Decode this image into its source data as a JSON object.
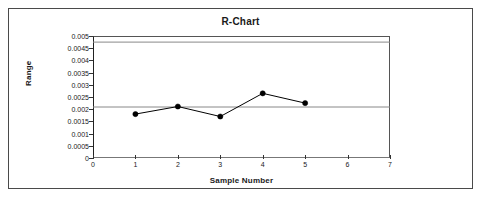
{
  "chart_data": {
    "type": "line",
    "title": "R-Chart",
    "xlabel": "Sample Number",
    "ylabel": "Range",
    "x": [
      1,
      2,
      3,
      4,
      5
    ],
    "values": [
      0.0018,
      0.00211,
      0.0017,
      0.00265,
      0.00225
    ],
    "series": [
      {
        "name": "Range",
        "values": [
          0.0018,
          0.00211,
          0.0017,
          0.00265,
          0.00225
        ]
      }
    ],
    "reference_lines": [
      {
        "name": "UCL",
        "value": 0.00475
      },
      {
        "name": "CL",
        "value": 0.00209
      },
      {
        "name": "LCL",
        "value": 0
      }
    ],
    "xlim": [
      0,
      7
    ],
    "ylim": [
      0,
      0.005
    ],
    "x_ticks": [
      0,
      1,
      2,
      3,
      4,
      5,
      6,
      7
    ],
    "x_tick_labels": [
      "0",
      "1",
      "2",
      "3",
      "4",
      "5",
      "6",
      "7"
    ],
    "y_ticks": [
      0,
      0.0005,
      0.001,
      0.0015,
      0.002,
      0.0025,
      0.003,
      0.0035,
      0.004,
      0.0045,
      0.005
    ],
    "y_tick_labels": [
      "0",
      "0.0005",
      "0.001",
      "0.0015",
      "0.002",
      "0.0025",
      "0.003",
      "0.0035",
      "0.004",
      "0.0045",
      "0.005"
    ],
    "grid": false,
    "legend": false,
    "marker": "filled-circle",
    "line_color": "#000000",
    "marker_color": "#000000",
    "reference_line_color": "#888888"
  }
}
